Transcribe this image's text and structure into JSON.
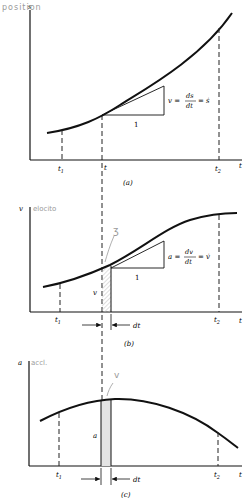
{
  "figures": {
    "a": {
      "caption": "(a)",
      "y_label": "s",
      "handwritten_label": "position",
      "x_label": "t",
      "ticks": {
        "t1": "t",
        "t1_sub": "1",
        "t": "t",
        "t2": "t",
        "t2_sub": "2"
      },
      "slope_label": {
        "lhs": "v =",
        "num": "ds",
        "den": "dt",
        "rhs": "= ṡ"
      },
      "run_label": "1"
    },
    "b": {
      "caption": "(b)",
      "y_label": "v",
      "handwritten_label": "elocito",
      "handwritten_mark": "ʒ",
      "x_label": "t",
      "ticks": {
        "t1": "t",
        "t1_sub": "1",
        "t2": "t",
        "t2_sub": "2"
      },
      "strip_label": "v",
      "dt_label": "dt",
      "slope_label": {
        "lhs": "a =",
        "num": "dv",
        "den": "dt",
        "rhs": "= v̇"
      },
      "run_label": "1"
    },
    "c": {
      "caption": "(c)",
      "y_label": "a",
      "handwritten_label": "accl.",
      "handwritten_mark": "v",
      "x_label": "t",
      "ticks": {
        "t1": "t",
        "t1_sub": "1",
        "t2": "t",
        "t2_sub": "2"
      },
      "strip_label": "a",
      "dt_label": "dt"
    }
  },
  "colors": {
    "ink": "#111111",
    "pencil": "#9a9a9a",
    "shade": "#d8d8d8"
  }
}
